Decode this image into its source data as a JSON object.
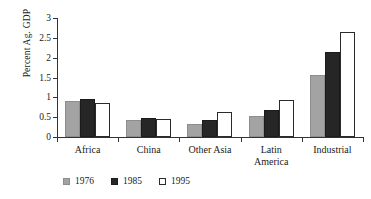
{
  "chart_data": {
    "type": "bar",
    "title": "",
    "xlabel": "",
    "ylabel": "Percent Ag. GDP",
    "ylim": [
      0,
      3
    ],
    "ytick_labels": [
      "0",
      "0.5",
      "1",
      "1.5",
      "2",
      "2.5",
      "3"
    ],
    "ytick_values": [
      0,
      0.5,
      1,
      1.5,
      2,
      2.5,
      3
    ],
    "grid": false,
    "legend_position": "bottom-left",
    "categories": [
      "Africa",
      "China",
      "Other Asia",
      "Latin\nAmerica",
      "Industrial"
    ],
    "series": [
      {
        "name": "1976",
        "color": "#a3a3a3",
        "values": [
          0.92,
          0.44,
          0.33,
          0.53,
          1.56
        ]
      },
      {
        "name": "1985",
        "color": "#262626",
        "values": [
          0.96,
          0.48,
          0.43,
          0.69,
          2.14
        ]
      },
      {
        "name": "1995",
        "color": "#ffffff",
        "values": [
          0.85,
          0.45,
          0.64,
          0.94,
          2.65
        ]
      }
    ]
  },
  "legend": {
    "items": [
      {
        "label": "1976",
        "swatch": "gray-square-icon"
      },
      {
        "label": "1985",
        "swatch": "black-square-icon"
      },
      {
        "label": "1995",
        "swatch": "white-square-icon"
      }
    ]
  }
}
